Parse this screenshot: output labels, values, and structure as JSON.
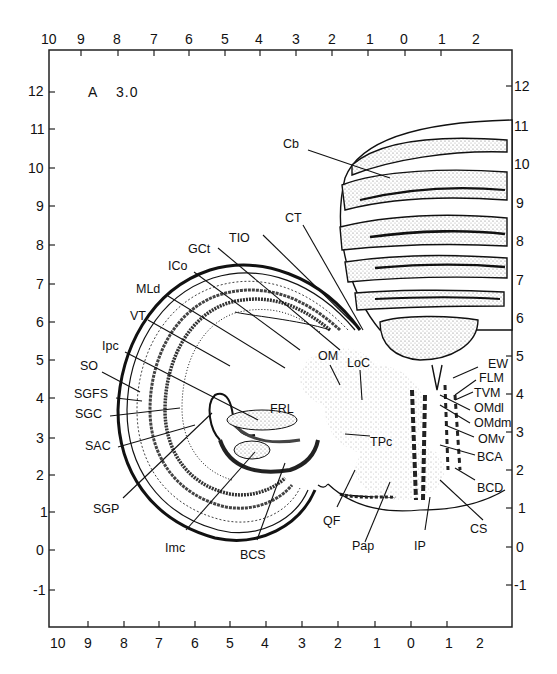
{
  "figure": {
    "plate_letter": "A",
    "plate_value": "3.0",
    "frame_color": "#222222",
    "ink_color": "#111111",
    "stipple_color": "#9a9a9a"
  },
  "axes": {
    "top": [
      "10",
      "9",
      "8",
      "7",
      "6",
      "5",
      "4",
      "3",
      "2",
      "1",
      "0",
      "1",
      "2"
    ],
    "bottom": [
      "10",
      "9",
      "8",
      "7",
      "6",
      "5",
      "4",
      "3",
      "2",
      "1",
      "0",
      "1",
      "2"
    ],
    "left": [
      "12",
      "11",
      "10",
      "9",
      "8",
      "7",
      "6",
      "5",
      "4",
      "3",
      "2",
      "1",
      "0",
      "-1"
    ],
    "right": [
      "12",
      "11",
      "10",
      "9",
      "8",
      "7",
      "6",
      "5",
      "4",
      "3",
      "2",
      "1",
      "0",
      "-1"
    ]
  },
  "labels": {
    "Cb": "Cb",
    "CT": "CT",
    "TIO": "TIO",
    "GCt": "GCt",
    "ICo": "ICo",
    "MLd": "MLd",
    "VT": "VT",
    "Ipc": "Ipc",
    "SO": "SO",
    "SGFS": "SGFS",
    "SGC": "SGC",
    "SAC": "SAC",
    "SGP": "SGP",
    "Imc": "Imc",
    "BCS": "BCS",
    "QF": "QF",
    "Pap": "Pap",
    "IP": "IP",
    "CS": "CS",
    "OM": "OM",
    "LoC": "LoC",
    "FRL": "FRL",
    "TPc": "TPc",
    "EW": "EW",
    "FLM": "FLM",
    "TVM": "TVM",
    "OMdl": "OMdl",
    "OMdm": "OMdm",
    "OMv": "OMv",
    "BCA": "BCA",
    "BCD": "BCD"
  }
}
